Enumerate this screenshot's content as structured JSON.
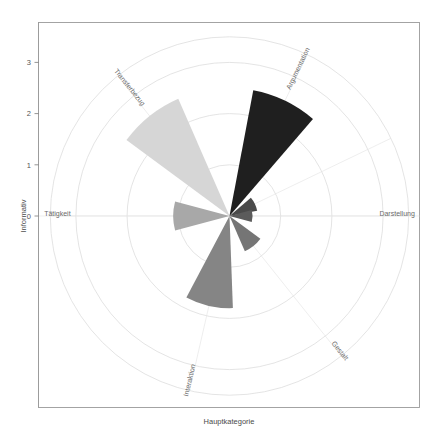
{
  "figure": {
    "background": "#ffffff",
    "panel_border_color": "#9a9a9a",
    "grid_color": "#d9d9d9"
  },
  "axis": {
    "y_title": "Informativ",
    "x_title": "Hauptkategorie",
    "y_ticks": [
      "0",
      "1",
      "2",
      "3"
    ],
    "y_tick_values": [
      0,
      1,
      2,
      3
    ]
  },
  "chart_data": {
    "type": "pie",
    "subtype": "polar-rose-windrose",
    "title": "",
    "subtitle": "",
    "xlabel": "Hauptkategorie",
    "ylabel": "Informativ",
    "ylim": [
      0,
      3.5
    ],
    "grid": true,
    "legend": "none",
    "coordinate_system": "polar",
    "wedge_angular_width_deg": 30,
    "sector_step_deg": 51.43,
    "categories": [
      "Argumentation",
      "Darstellung",
      "Gestalt",
      "Interaktion",
      "Tätigkeit",
      "Transferbezug"
    ],
    "values": [
      2.5,
      0.45,
      0.75,
      1.8,
      1.1,
      2.5
    ],
    "colors": [
      "#1f1f1f",
      "#5b5b5b",
      "#757575",
      "#858585",
      "#a8a8a8",
      "#d6d6d6"
    ],
    "series": [
      {
        "name": "Informativ",
        "points": [
          {
            "label": "Argumentation",
            "value": 2.5,
            "angle_deg": 25.7,
            "color": "#1f1f1f"
          },
          {
            "label": "",
            "value": 0.55,
            "angle_deg": 64.3,
            "color": "#4a4a4a"
          },
          {
            "label": "Darstellung",
            "value": 0.45,
            "angle_deg": 90.0,
            "color": "#5b5b5b"
          },
          {
            "label": "Gestalt",
            "value": 0.75,
            "angle_deg": 141.4,
            "color": "#757575"
          },
          {
            "label": "Interaktion",
            "value": 1.8,
            "angle_deg": 192.9,
            "color": "#858585"
          },
          {
            "label": "Tätigkeit",
            "value": 1.1,
            "angle_deg": 270.0,
            "color": "#a8a8a8"
          },
          {
            "label": "Transferbezug",
            "value": 2.5,
            "angle_deg": 321.4,
            "color": "#d6d6d6"
          }
        ]
      }
    ],
    "grid_radii": [
      1,
      2,
      3,
      3.5
    ],
    "annotations": []
  },
  "category_labels": [
    {
      "text": "Argumentation",
      "angle_deg": 25.7
    },
    {
      "text": "Darstellung",
      "angle_deg": 90.0
    },
    {
      "text": "Gestalt",
      "angle_deg": 141.4
    },
    {
      "text": "Interaktion",
      "angle_deg": 192.9
    },
    {
      "text": "Tätigkeit",
      "angle_deg": 270.0
    },
    {
      "text": "Transferbezug",
      "angle_deg": 321.4
    }
  ]
}
